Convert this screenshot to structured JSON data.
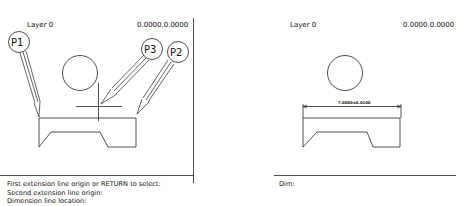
{
  "left_viewport": {
    "layer_label": "Layer 0",
    "coordinates": "0.0000,0.0000",
    "point_markers": [
      {
        "id": "p1",
        "label": "P1"
      },
      {
        "id": "p3",
        "label": "P3"
      },
      {
        "id": "p2",
        "label": "P2"
      }
    ],
    "command_lines": [
      "First extension line origin or RETURN to select:",
      "Second extension line origin:",
      "Dimension line location:"
    ]
  },
  "right_viewport": {
    "layer_label": "Layer 0",
    "coordinates": "0.0000,0.0000",
    "dimension_text": "7.0000±0.0100",
    "command_prompt": "Dim:"
  },
  "colors": {
    "stroke": "#222222",
    "background": "#ffffff"
  }
}
